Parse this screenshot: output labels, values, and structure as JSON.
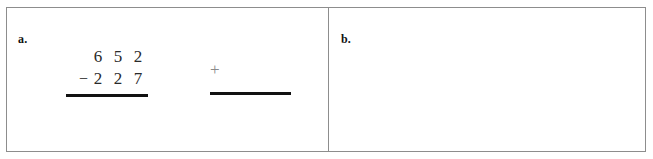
{
  "worksheet": {
    "panels": [
      {
        "label": "a.",
        "problem": {
          "minuend": [
            "6",
            "5",
            "2"
          ],
          "operator": "−",
          "subtrahend": [
            "2",
            "2",
            "7"
          ],
          "answer": ""
        },
        "check": {
          "operator": "+",
          "answer": ""
        }
      },
      {
        "label": "b.",
        "problem": {
          "minuend": [
            "5",
            "4",
            "8"
          ],
          "operator": "−",
          "subtrahend": [
            "1",
            "8",
            "5"
          ],
          "answer": ""
        },
        "check": {
          "operator": "+",
          "answer": ""
        }
      }
    ],
    "colors": {
      "frame": "#8d8d8d",
      "rule": "#111111",
      "digit": "#2a2a2a",
      "check_sign": "#8a8a8a",
      "background": "#ffffff"
    }
  }
}
